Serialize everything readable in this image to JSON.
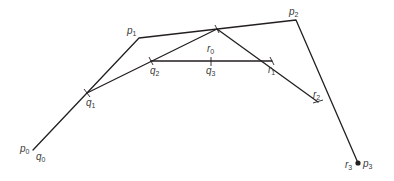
{
  "diagram": {
    "title": "",
    "control_points": {
      "p0": {
        "label": "p",
        "sub": "0",
        "x": 33,
        "y": 150
      },
      "p1": {
        "label": "p",
        "sub": "1",
        "x": 139,
        "y": 38
      },
      "p2": {
        "label": "p",
        "sub": "2",
        "x": 296,
        "y": 20
      },
      "p3": {
        "label": "p",
        "sub": "3",
        "x": 358,
        "y": 163
      }
    },
    "subdivision_points": {
      "q0": {
        "label": "q",
        "sub": "0"
      },
      "q1": {
        "label": "q",
        "sub": "1",
        "x": 87,
        "y": 93
      },
      "q2": {
        "label": "q",
        "sub": "2",
        "x": 151,
        "y": 61
      },
      "q3": {
        "label": "q",
        "sub": "3",
        "x": 211,
        "y": 61
      },
      "r0": {
        "label": "r",
        "sub": "0"
      },
      "r1": {
        "label": "r",
        "sub": "1",
        "x": 272,
        "y": 61
      },
      "r2": {
        "label": "r",
        "sub": "2",
        "x": 318,
        "y": 102
      },
      "r3": {
        "label": "r",
        "sub": "3"
      },
      "mid": {
        "x": 217,
        "y": 29
      }
    },
    "colors": {
      "line": "#231f20",
      "text": "#3a3a3a",
      "background": "#ffffff"
    }
  }
}
